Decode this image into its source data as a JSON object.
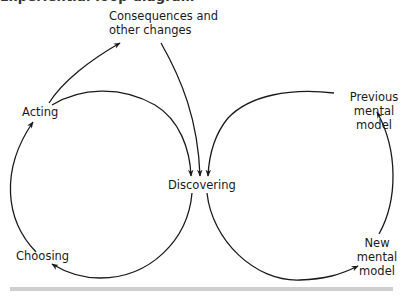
{
  "title_cut": "Experiential loop diagram",
  "nodes": {
    "consequences": [
      "Consequences and",
      "other changes"
    ],
    "acting": "Acting",
    "discovering": "Discovering",
    "choosing": "Choosing",
    "previous_model": [
      "Previous",
      "mental",
      "model"
    ],
    "new_model": [
      "New",
      "mental",
      "model"
    ]
  },
  "edges": [
    {
      "from": "Acting",
      "to": "Consequences and other changes"
    },
    {
      "from": "Consequences and other changes",
      "to": "Discovering"
    },
    {
      "from": "Acting",
      "to": "Discovering"
    },
    {
      "from": "Discovering",
      "to": "Choosing"
    },
    {
      "from": "Choosing",
      "to": "Acting"
    },
    {
      "from": "Discovering",
      "to": "New mental model"
    },
    {
      "from": "New mental model",
      "to": "Previous mental model"
    },
    {
      "from": "Previous mental model",
      "to": "Discovering"
    }
  ],
  "colors": {
    "stroke": "#1a1a1a",
    "rule": "#cfcfcf"
  }
}
